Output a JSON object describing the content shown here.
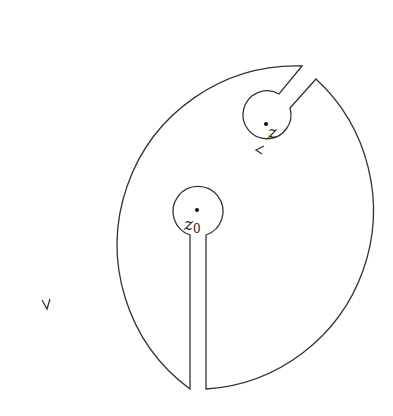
{
  "diagram": {
    "type": "keyhole-contour",
    "stroke_color": "#333333",
    "background": "#ffffff",
    "outer_circle": {
      "cx": 197,
      "cy": 212,
      "r": 179
    },
    "slot": {
      "left_x": 190,
      "right_x": 206
    },
    "point_z0": {
      "label": "z",
      "subscript": "0",
      "cx": 197,
      "cy": 211,
      "r": 25
    },
    "point_z": {
      "label": "z",
      "cx": 266,
      "cy": 126,
      "r": 24
    },
    "arrows": [
      {
        "location": "outer-left",
        "direction": "counterclockwise"
      },
      {
        "location": "z-circle-bottom",
        "direction": "clockwise"
      }
    ]
  }
}
